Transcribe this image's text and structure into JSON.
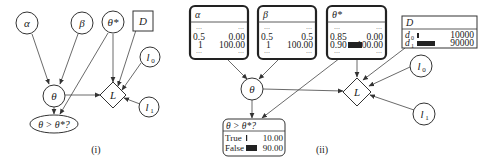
{
  "panel_i": {
    "label": "(i)",
    "nodes": {
      "alpha": "α",
      "beta": "β",
      "theta_star": "θ*",
      "D": "D",
      "theta": "θ",
      "L": "L",
      "l0": "l",
      "l0_sub": "0",
      "l1": "l",
      "l1_sub": "1",
      "query": "θ > θ*?"
    }
  },
  "panel_ii": {
    "label": "(ii)",
    "alpha_box": {
      "title": "α",
      "dots": "···",
      "rows": [
        {
          "state": "0.5",
          "value": "0.00"
        },
        {
          "state": "1",
          "value": "100.00"
        }
      ]
    },
    "beta_box": {
      "title": "β",
      "dots": "···",
      "rows": [
        {
          "state": "0.5",
          "value": "0.5"
        },
        {
          "state": "1",
          "value": "100.00"
        }
      ]
    },
    "theta_star_box": {
      "title": "θ*",
      "dots": "···",
      "rows": [
        {
          "state": "0.85",
          "value": "0.00"
        },
        {
          "state": "0.90",
          "value": "100.00"
        }
      ]
    },
    "D_box": {
      "title": "D",
      "rows": [
        {
          "state": "d",
          "sub": "0",
          "value": "10000"
        },
        {
          "state": "d",
          "sub": "1",
          "value": "90000"
        }
      ]
    },
    "query_box": {
      "title": "θ > θ*?",
      "rows": [
        {
          "state": "True",
          "value": "10.00"
        },
        {
          "state": "False",
          "value": "90.00"
        }
      ]
    },
    "nodes": {
      "theta": "θ",
      "L": "L",
      "l0": "l",
      "l0_sub": "0",
      "l1": "l",
      "l1_sub": "1"
    }
  }
}
